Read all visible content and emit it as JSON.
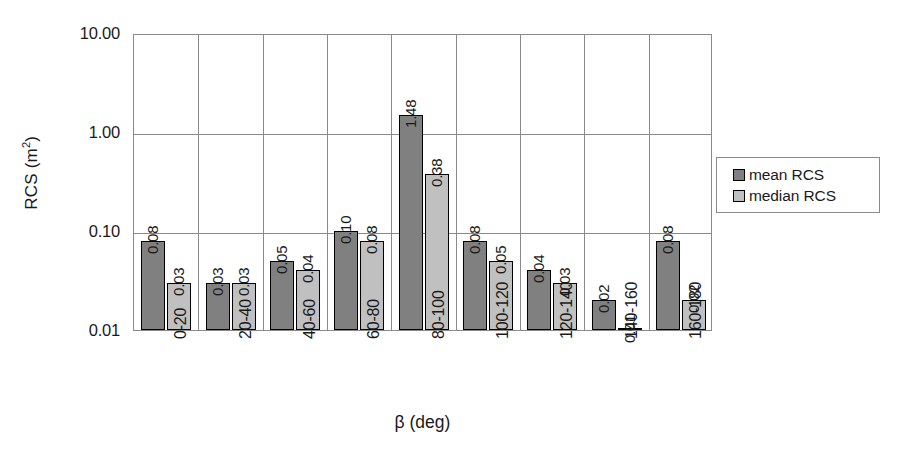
{
  "chart_data": {
    "type": "bar",
    "title": "",
    "xlabel": "β (deg)",
    "ylabel": "RCS (m²)",
    "ylabel_base": "RCS (m",
    "ylabel_sup": "2",
    "ylabel_tail": ")",
    "scale": "log",
    "ylim": [
      0.01,
      10.0
    ],
    "ytick_labels": [
      "10.00",
      "1.00",
      "0.10",
      "0.01"
    ],
    "ytick_values": [
      10.0,
      1.0,
      0.1,
      0.01
    ],
    "grid": "both",
    "legend_position": "right",
    "categories": [
      "0-20",
      "20-40",
      "40-60",
      "60-80",
      "80-100",
      "100-120",
      "120-140",
      "140-160",
      "160-180"
    ],
    "series": [
      {
        "name": "mean RCS",
        "color": "#808080",
        "values": [
          0.08,
          0.03,
          0.05,
          0.1,
          1.48,
          0.08,
          0.04,
          0.02,
          0.08
        ],
        "labels": [
          "0.08",
          "0.03",
          "0.05",
          "0.10",
          "1.48",
          "0.08",
          "0.04",
          "0.02",
          "0.08"
        ]
      },
      {
        "name": "median RCS",
        "color": "#c0c0c0",
        "values": [
          0.03,
          0.03,
          0.04,
          0.08,
          0.38,
          0.05,
          0.03,
          0.01,
          0.02
        ],
        "labels": [
          "0.03",
          "0.03",
          "0.04",
          "0.08",
          "0.38",
          "0.05",
          "0.03",
          "0.01",
          "0.02"
        ]
      }
    ]
  },
  "legend": {
    "items": [
      {
        "label": "mean RCS",
        "color": "#808080"
      },
      {
        "label": "median RCS",
        "color": "#c0c0c0"
      }
    ]
  }
}
